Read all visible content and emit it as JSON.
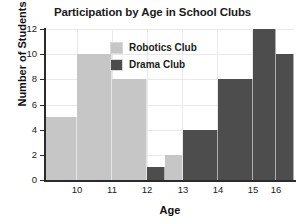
{
  "chart_data": {
    "type": "bar",
    "title": "Participation by Age in School Clubs",
    "xlabel": "Age",
    "ylabel": "Number of Students",
    "ylim": [
      0,
      12
    ],
    "yticks": [
      0,
      2,
      4,
      6,
      8,
      10,
      12
    ],
    "xticks": [
      10,
      11,
      12,
      13,
      14,
      15,
      16
    ],
    "grid": true,
    "legend_position": "upper-center",
    "categories": [
      "9.5-10",
      "10-11",
      "11-12",
      "12-12.5",
      "12.5-13",
      "13-14",
      "14-15",
      "15-16",
      "16-16.5"
    ],
    "series": [
      {
        "name": "Robotics Club",
        "color": "#c6c6c6",
        "values": [
          5,
          10,
          8,
          0,
          2,
          0,
          0,
          0,
          0
        ]
      },
      {
        "name": "Drama Club",
        "color": "#4d4d4d",
        "values": [
          0,
          0,
          0,
          1,
          0,
          4,
          8,
          12,
          10
        ]
      }
    ],
    "bars": [
      {
        "label": "9.5-10",
        "series": "Robotics Club",
        "value": 5,
        "color": "#c6c6c6",
        "x0": 0,
        "x1": 31
      },
      {
        "label": "10-11",
        "series": "Robotics Club",
        "value": 10,
        "color": "#c6c6c6",
        "x0": 31,
        "x1": 66
      },
      {
        "label": "11-12",
        "series": "Robotics Club",
        "value": 8,
        "color": "#c6c6c6",
        "x0": 66,
        "x1": 101
      },
      {
        "label": "12-12.5",
        "series": "Drama Club",
        "value": 1,
        "color": "#4d4d4d",
        "x0": 101,
        "x1": 136
      },
      {
        "label": "12.5-13",
        "series": "Robotics Club",
        "value": 2,
        "color": "#c6c6c6",
        "x0": 136,
        "x1": 171
      },
      {
        "label": "13-14",
        "series": "Drama Club",
        "value": 4,
        "color": "#4d4d4d",
        "x0": 171,
        "x1": 206
      },
      {
        "label": "14-15",
        "series": "Drama Club",
        "value": 8,
        "color": "#4d4d4d",
        "x0": 206,
        "x1": 213
      },
      {
        "label": "15-16",
        "series": "Drama Club",
        "value": 12,
        "color": "#4d4d4d",
        "x0": 213,
        "x1": 248
      },
      {
        "label": "16-16.5",
        "series": "Drama Club",
        "value": 10,
        "color": "#4d4d4d",
        "x0": 248,
        "x1": 248
      }
    ]
  },
  "legend": {
    "items": [
      {
        "label": "Robotics Club",
        "color": "#c6c6c6"
      },
      {
        "label": "Drama Club",
        "color": "#4d4d4d"
      }
    ]
  },
  "colors": {
    "robotics": "#c6c6c6",
    "drama": "#4d4d4d",
    "axis": "#2b2b2b",
    "grid": "#e9e9e9",
    "text": "#1b1b1b",
    "background": "#ffffff"
  }
}
